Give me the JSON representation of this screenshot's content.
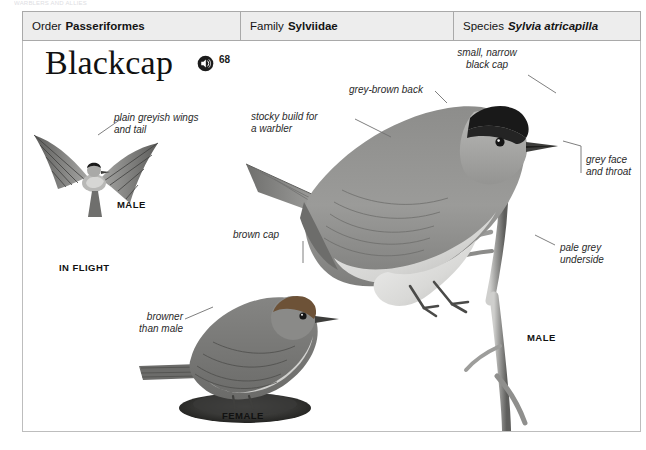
{
  "running_head": "WARBLERS AND ALLIES",
  "taxonomy": [
    {
      "label": "Order",
      "value": "Passeriformes",
      "italic": false
    },
    {
      "label": "Family",
      "value": "Sylviidae",
      "italic": false
    },
    {
      "label": "Species",
      "value": "Sylvia atricapilla",
      "italic": true
    }
  ],
  "title": "Blackcap",
  "audio": {
    "icon": "speaker-icon",
    "track_number": "68"
  },
  "annotations": {
    "wings_tail": "plain greyish wings\nand tail",
    "stocky_build": "stocky build for\na warbler",
    "back": "grey-brown back",
    "black_cap": "small, narrow\nblack cap",
    "face_throat": "grey face\nand throat",
    "underside": "pale grey\nunderside",
    "brown_cap": "brown cap",
    "browner": "browner\nthan male"
  },
  "captions": {
    "flight_sex": "MALE",
    "in_flight": "IN FLIGHT",
    "female": "FEMALE",
    "perched_sex": "MALE"
  },
  "colors": {
    "header_fill": "#ededed",
    "header_rule": "#a9a9a9",
    "text": "#141414",
    "leader": "#717171",
    "cap_black": "#1a1a1a",
    "back_grey": "#8e8e8e",
    "underside": "#d8d8d6",
    "female_cap": "#6b4f3a"
  }
}
